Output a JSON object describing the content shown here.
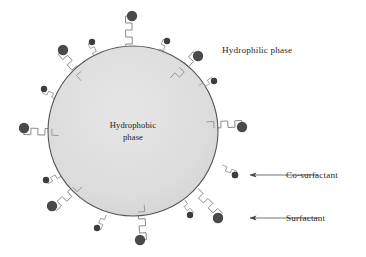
{
  "figure": {
    "type": "schematic-diagram",
    "background_color": "#ffffff"
  },
  "core": {
    "label_line1": "Hydrophobic",
    "label_line2": "phase",
    "fill_color": "#dedede",
    "stroke_color": "#555555",
    "center_x": 133,
    "center_y": 131,
    "radius": 85
  },
  "labels": {
    "hydrophilic": "Hydrophilic phase",
    "co_surfactant": "Co-surfactant",
    "surfactant": "Surfactant"
  },
  "legend_callouts": [
    {
      "name": "co-surfactant",
      "label": "Co-surfactant",
      "marker_type": "small-dot",
      "marker_x": 235,
      "marker_y": 175,
      "marker_r": 3.2,
      "arrow_from_x": 318,
      "arrow_to_x": 248,
      "arrow_y": 175,
      "text_x": 286,
      "text_y": 178
    },
    {
      "name": "surfactant",
      "label": "Surfactant",
      "marker_type": "large-dot",
      "marker_x": 218,
      "marker_y": 218,
      "marker_r": 5.0,
      "arrow_from_x": 318,
      "arrow_to_x": 248,
      "arrow_y": 218,
      "text_x": 286,
      "text_y": 221
    }
  ],
  "hydrophilic_label": {
    "text": "Hydrophilic phase",
    "x": 222,
    "y": 53
  },
  "colors": {
    "head_dark": "#4a4a4a",
    "head_small_dark": "#3d3d3d",
    "tail_stroke": "#8a8a8a",
    "core_fill": "#dedede",
    "core_stroke": "#555555",
    "text": "#2a2a2a",
    "arrow": "#555555"
  },
  "surfactants": [
    {
      "id": "s1",
      "head_x": 132,
      "head_y": 16,
      "head_r": 5.2,
      "angle_deg": 270
    },
    {
      "id": "s2",
      "head_x": 63,
      "head_y": 50,
      "head_r": 5.2,
      "angle_deg": 225
    },
    {
      "id": "s3",
      "head_x": 24,
      "head_y": 128,
      "head_r": 5.2,
      "angle_deg": 182
    },
    {
      "id": "s4",
      "head_x": 52,
      "head_y": 206,
      "head_r": 5.2,
      "angle_deg": 138
    },
    {
      "id": "s5",
      "head_x": 140,
      "head_y": 240,
      "head_r": 5.2,
      "angle_deg": 92
    },
    {
      "id": "s6",
      "head_x": 218,
      "head_y": 218,
      "head_r": 5.2,
      "angle_deg": 52
    },
    {
      "id": "s7",
      "head_x": 242,
      "head_y": 127,
      "head_r": 5.2,
      "angle_deg": 3
    },
    {
      "id": "s8",
      "head_x": 198,
      "head_y": 56,
      "head_r": 5.2,
      "angle_deg": 312
    }
  ],
  "cosurfactants": [
    {
      "id": "c1",
      "head_x": 92,
      "head_y": 42,
      "head_r": 3.2,
      "angle_deg": 248
    },
    {
      "id": "c2",
      "head_x": 167,
      "head_y": 41,
      "head_r": 3.2,
      "angle_deg": 290
    },
    {
      "id": "c3",
      "head_x": 44,
      "head_y": 89,
      "head_r": 3.2,
      "angle_deg": 207
    },
    {
      "id": "c4",
      "head_x": 214,
      "head_y": 81,
      "head_r": 3.2,
      "angle_deg": 330
    },
    {
      "id": "c5",
      "head_x": 46,
      "head_y": 180,
      "head_r": 3.2,
      "angle_deg": 158
    },
    {
      "id": "c6",
      "head_x": 235,
      "head_y": 175,
      "head_r": 3.2,
      "angle_deg": 27
    },
    {
      "id": "c7",
      "head_x": 97,
      "head_y": 228,
      "head_r": 3.2,
      "angle_deg": 112
    },
    {
      "id": "c8",
      "head_x": 190,
      "head_y": 215,
      "head_r": 3.2,
      "angle_deg": 62
    }
  ]
}
